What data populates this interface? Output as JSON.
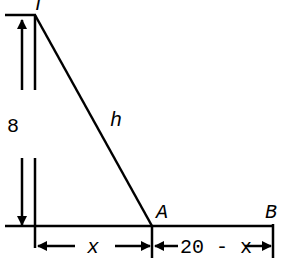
{
  "labels": {
    "top": "T",
    "height": "8",
    "hyp": "h",
    "pointA": "A",
    "pointB": "B",
    "left_seg": "x",
    "right_seg": "20 - x"
  },
  "colors": {
    "stroke": "#000000",
    "background": "#ffffff"
  }
}
